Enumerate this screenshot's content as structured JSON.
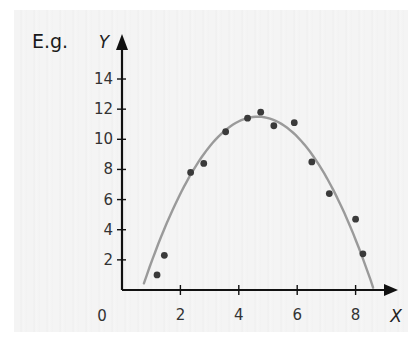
{
  "prefix_label": "E.g.",
  "chart_data": {
    "type": "scatter",
    "title": "",
    "xlabel": "X",
    "ylabel": "Y",
    "xlim": [
      0,
      9
    ],
    "ylim": [
      0,
      15.5
    ],
    "grid": false,
    "legend": null,
    "x_ticks": [
      2,
      4,
      6,
      8
    ],
    "x_tick_labels": [
      "2",
      "4",
      "6",
      "8"
    ],
    "y_ticks": [
      2,
      4,
      6,
      8,
      10,
      12,
      14
    ],
    "y_tick_labels": [
      "2",
      "4",
      "6",
      "8",
      "10",
      "12",
      "14"
    ],
    "origin_label": "0",
    "series": [
      {
        "name": "data points",
        "kind": "scatter",
        "color": "#3a3a3a",
        "points": [
          {
            "x": 1.2,
            "y": 1.0
          },
          {
            "x": 1.45,
            "y": 2.3
          },
          {
            "x": 2.35,
            "y": 7.8
          },
          {
            "x": 2.8,
            "y": 8.4
          },
          {
            "x": 3.55,
            "y": 10.5
          },
          {
            "x": 4.3,
            "y": 11.4
          },
          {
            "x": 4.75,
            "y": 11.8
          },
          {
            "x": 5.2,
            "y": 10.9
          },
          {
            "x": 5.9,
            "y": 11.1
          },
          {
            "x": 6.5,
            "y": 8.5
          },
          {
            "x": 7.1,
            "y": 6.4
          },
          {
            "x": 8.0,
            "y": 4.7
          },
          {
            "x": 8.25,
            "y": 2.4
          }
        ]
      },
      {
        "name": "quadratic fit",
        "kind": "curve",
        "color": "#9a9a9a",
        "equation": "y = 11.5 - 0.727(x - 4.65)^2",
        "x_range": [
          0.75,
          8.6
        ]
      }
    ]
  },
  "colors": {
    "axis": "#111111",
    "panel_bg": "#f3f3f3",
    "point": "#3a3a3a",
    "curve": "#9a9a9a"
  }
}
